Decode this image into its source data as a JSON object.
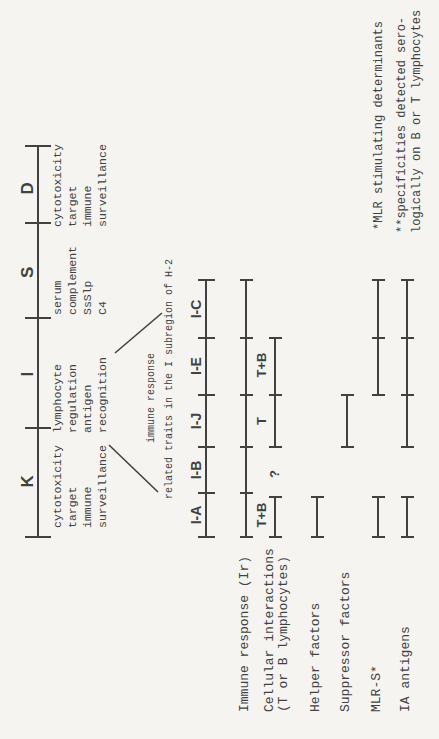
{
  "figure": {
    "bg": "#f5f4f1",
    "ink": "#414141",
    "width": 439,
    "height": 739
  },
  "main_map": {
    "axis": {
      "y": 38,
      "x1": 202,
      "x2": 593,
      "ticks": [
        202,
        311,
        421,
        516,
        593
      ]
    },
    "regions": [
      {
        "label": "K",
        "label_x": 258,
        "text_x": 211,
        "functions": [
          "cytotoxicity",
          "target",
          "immune",
          "surveillance"
        ]
      },
      {
        "label": "I",
        "label_x": 365,
        "text_x": 306,
        "functions": [
          "lymphocyte",
          "regulation",
          "antigen",
          "recognition"
        ]
      },
      {
        "label": "S",
        "label_x": 467,
        "text_x": 424,
        "functions": [
          "serum",
          "complement",
          "SsSlp",
          "C4"
        ]
      },
      {
        "label": "D",
        "label_x": 551,
        "text_x": 512,
        "functions": [
          "cytotoxicity",
          "target",
          "immune",
          "surveillance"
        ]
      }
    ]
  },
  "connectors": [
    {
      "x1": 294,
      "y1": 109,
      "x2": 247,
      "y2": 158
    },
    {
      "x1": 386,
      "y1": 115,
      "x2": 426,
      "y2": 162
    }
  ],
  "caption": {
    "line1": "immune response",
    "line2": "related traits in the I subregion of H-2",
    "cx1": 341,
    "cy1": 152,
    "cx2": 360,
    "cy2": 170
  },
  "subregion_map": {
    "axis": {
      "y": 206,
      "x1": 202,
      "x2": 459,
      "ticks": [
        202,
        246,
        292,
        344,
        401,
        459
      ]
    },
    "label_top": 189,
    "labels": [
      {
        "text": "I-A",
        "x": 224
      },
      {
        "text": "I-B",
        "x": 269
      },
      {
        "text": "I-J",
        "x": 318
      },
      {
        "text": "I-E",
        "x": 373
      },
      {
        "text": "I-C",
        "x": 430
      }
    ]
  },
  "trait_label_x": 27,
  "trait_rows": [
    {
      "label_lines": [
        "Immune response (Ir)"
      ],
      "y": 246,
      "segments": [
        {
          "x1": 202,
          "x2": 459,
          "ticks": [
            246,
            292,
            344,
            401
          ]
        }
      ],
      "annotations": []
    },
    {
      "label_lines": [
        "Cellular interactions",
        "(T or B lymphocytes)"
      ],
      "y": 275,
      "segments": [
        {
          "x1": 202,
          "x2": 242,
          "ticks": []
        },
        {
          "x1": 292,
          "x2": 401,
          "ticks": [
            344
          ]
        }
      ],
      "annotations": [
        {
          "text": "T+B",
          "x": 224,
          "y": 262
        },
        {
          "text": "?",
          "x": 265,
          "y": 275
        },
        {
          "text": "T",
          "x": 318,
          "y": 262
        },
        {
          "text": "T+B",
          "x": 374,
          "y": 262
        }
      ]
    },
    {
      "label_lines": [
        "Helper factors"
      ],
      "y": 317,
      "segments": [
        {
          "x1": 202,
          "x2": 242,
          "ticks": []
        }
      ],
      "annotations": []
    },
    {
      "label_lines": [
        "Suppressor factors"
      ],
      "y": 347,
      "segments": [
        {
          "x1": 292,
          "x2": 344,
          "ticks": []
        }
      ],
      "annotations": []
    },
    {
      "label_lines": [
        "MLR-S*"
      ],
      "y": 378,
      "segments": [
        {
          "x1": 202,
          "x2": 242,
          "ticks": []
        },
        {
          "x1": 344,
          "x2": 459,
          "ticks": [
            401
          ]
        }
      ],
      "annotations": []
    },
    {
      "label_lines": [
        "IA antigens"
      ],
      "y": 407,
      "segments": [
        {
          "x1": 202,
          "x2": 242,
          "ticks": []
        },
        {
          "x1": 292,
          "x2": 459,
          "ticks": [
            344,
            401
          ]
        }
      ],
      "annotations": []
    }
  ],
  "footnotes": [
    {
      "lines": [
        "*MLR stimulating determinants"
      ],
      "x": 509,
      "y": 372
    },
    {
      "lines": [
        "**specificities detected sero-",
        "logically on B or T lymphocytes"
      ],
      "x": 506,
      "y": 395
    }
  ]
}
